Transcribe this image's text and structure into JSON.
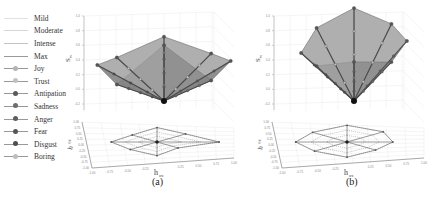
{
  "chart_data": [
    {
      "type": "3d-surface-radar",
      "panel": "(a)",
      "title": "",
      "zlabel": "S_w",
      "xlabel": "h_ox",
      "ylabel": "h_ox (depth axis)",
      "zticks": [
        "1.0",
        "0.8",
        "0.6",
        "0.4",
        "0.2",
        "0.0",
        "-0.2"
      ],
      "xticks": [
        "-1.00",
        "-0.75",
        "-0.50",
        "-0.25",
        "0.25",
        "0.50",
        "0.75",
        "1.00"
      ],
      "yticks": [
        "1.00",
        "0.75",
        "0.50",
        "0.25",
        "0.00",
        "-0.25",
        "-0.50",
        "-0.75",
        "-1.00"
      ],
      "zlim": [
        -0.2,
        1.0
      ],
      "grid": true,
      "series": [
        {
          "name": "Joy",
          "peak": 0.6
        },
        {
          "name": "Trust",
          "peak": 0.45
        },
        {
          "name": "Antipation",
          "peak": 0.5
        },
        {
          "name": "Sadness",
          "peak": 0.4
        },
        {
          "name": "Anger",
          "peak": 0.9
        },
        {
          "name": "Fear",
          "peak": 0.35
        },
        {
          "name": "Disgust",
          "peak": 0.45
        },
        {
          "name": "Boring",
          "peak": 0.4
        }
      ]
    },
    {
      "type": "3d-surface-radar",
      "panel": "(b)",
      "title": "",
      "zlabel": "S_w",
      "xlabel": "h_ox",
      "ylabel": "h_ox (depth axis)",
      "zticks": [
        "1.0",
        "0.8",
        "0.6",
        "0.4",
        "0.2",
        "0.0",
        "-0.2"
      ],
      "xticks": [
        "-1.00",
        "-0.75",
        "-0.50",
        "-0.25",
        "0.25",
        "0.50",
        "0.75",
        "1.00"
      ],
      "yticks": [
        "1.00",
        "0.75",
        "0.50",
        "0.25",
        "0.00",
        "-0.25",
        "-0.50",
        "-0.75",
        "-1.00"
      ],
      "zlim": [
        -0.2,
        1.0
      ],
      "grid": true,
      "series": [
        {
          "name": "Joy",
          "peak": 1.0
        },
        {
          "name": "Trust",
          "peak": 0.85
        },
        {
          "name": "Antipation",
          "peak": 0.75
        },
        {
          "name": "Sadness",
          "peak": 0.6
        },
        {
          "name": "Anger",
          "peak": 0.65
        },
        {
          "name": "Fear",
          "peak": 0.55
        },
        {
          "name": "Disgust",
          "peak": 0.6
        },
        {
          "name": "Boring",
          "peak": 0.8
        }
      ]
    }
  ],
  "legend": {
    "items": [
      {
        "label": "Mild",
        "style": "line",
        "color": "#e2e2e2"
      },
      {
        "label": "Moderate",
        "style": "line",
        "color": "#d6d6d6"
      },
      {
        "label": "Intense",
        "style": "line",
        "color": "#c4c4c4"
      },
      {
        "label": "Max",
        "style": "line",
        "color": "#9a9a9a"
      },
      {
        "label": "Joy",
        "style": "marker",
        "color": "#b4b4b4"
      },
      {
        "label": "Trust",
        "style": "marker",
        "color": "#c2c2c2"
      },
      {
        "label": "Antipation",
        "style": "marker",
        "color": "#5a5a5a"
      },
      {
        "label": "Sadness",
        "style": "marker",
        "color": "#6c6c6c"
      },
      {
        "label": "Anger",
        "style": "marker",
        "color": "#5e5e5e"
      },
      {
        "label": "Fear",
        "style": "marker",
        "color": "#555555"
      },
      {
        "label": "Disgust",
        "style": "marker",
        "color": "#4e4e4e"
      },
      {
        "label": "Boring",
        "style": "marker",
        "color": "#bdbdbd"
      }
    ]
  },
  "panels": {
    "a": {
      "caption": "(a)",
      "zlabel": "S",
      "zlabel_sub": "w",
      "xlabel": "h",
      "xlabel_sub": "ox",
      "ylabel": "h",
      "ylabel_sub": "ox"
    },
    "b": {
      "caption": "(b)",
      "zlabel": "S",
      "zlabel_sub": "w",
      "xlabel": "h",
      "xlabel_sub": "ox",
      "ylabel": "h",
      "ylabel_sub": "ox"
    }
  }
}
